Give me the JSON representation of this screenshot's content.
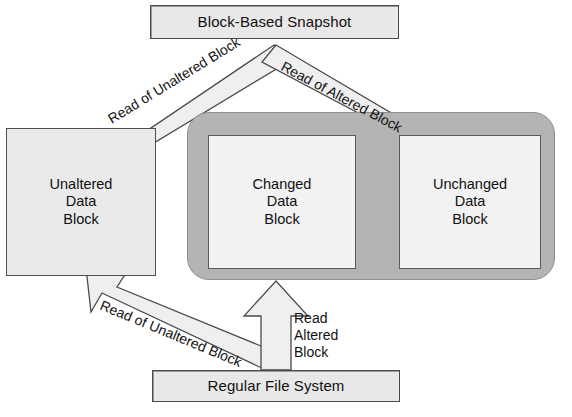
{
  "diagram": {
    "type": "block-snapshot-flow",
    "title_box": {
      "label": "Block-Based Snapshot"
    },
    "bottom_box": {
      "label": "Regular File System"
    },
    "blocks": [
      {
        "id": "unaltered",
        "line1": "Unaltered",
        "line2": "Data",
        "line3": "Block"
      },
      {
        "id": "changed",
        "line1": "Changed",
        "line2": "Data",
        "line3": "Block"
      },
      {
        "id": "unchanged",
        "line1": "Unchanged",
        "line2": "Data",
        "line3": "Block"
      }
    ],
    "arrows": [
      {
        "id": "snapshot-to-unaltered",
        "label": "Read of Unaltered Block"
      },
      {
        "id": "snapshot-to-unchanged",
        "label": "Read of Altered Block"
      },
      {
        "id": "fs-to-unaltered",
        "label": "Read of Unaltered Block"
      },
      {
        "id": "fs-to-changed",
        "line1": "Read",
        "line2": "Altered",
        "line3": "Block"
      }
    ],
    "colors": {
      "box_fill": "#e8e8e8",
      "block_fill": "#eaeaea",
      "inner_block_fill": "#f2f2f2",
      "container_fill": "#b4b4b4",
      "arrow_fill": "#efefef",
      "outline": "#4a4a4a"
    }
  }
}
